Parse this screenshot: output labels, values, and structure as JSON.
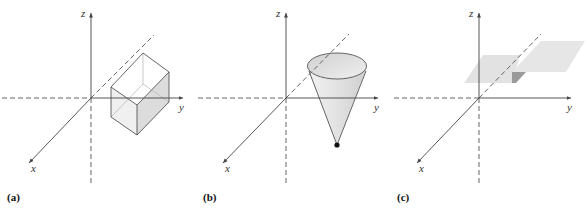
{
  "panels": [
    {
      "id": "a",
      "label": "(a)",
      "shape": "rectangular-box",
      "axes": {
        "x": "x",
        "y": "y",
        "z": "z"
      }
    },
    {
      "id": "b",
      "label": "(b)",
      "shape": "cone",
      "axes": {
        "x": "x",
        "y": "y",
        "z": "z"
      }
    },
    {
      "id": "c",
      "label": "(c)",
      "shape": "horizontal-plane",
      "axes": {
        "x": "x",
        "y": "y",
        "z": "z"
      }
    }
  ],
  "colors": {
    "axis": "#444444",
    "fill_light": "#e6e6e6",
    "fill_mid": "#d4d4d4",
    "fill_dark": "#9a9a9a",
    "apex_dot": "#111111"
  }
}
